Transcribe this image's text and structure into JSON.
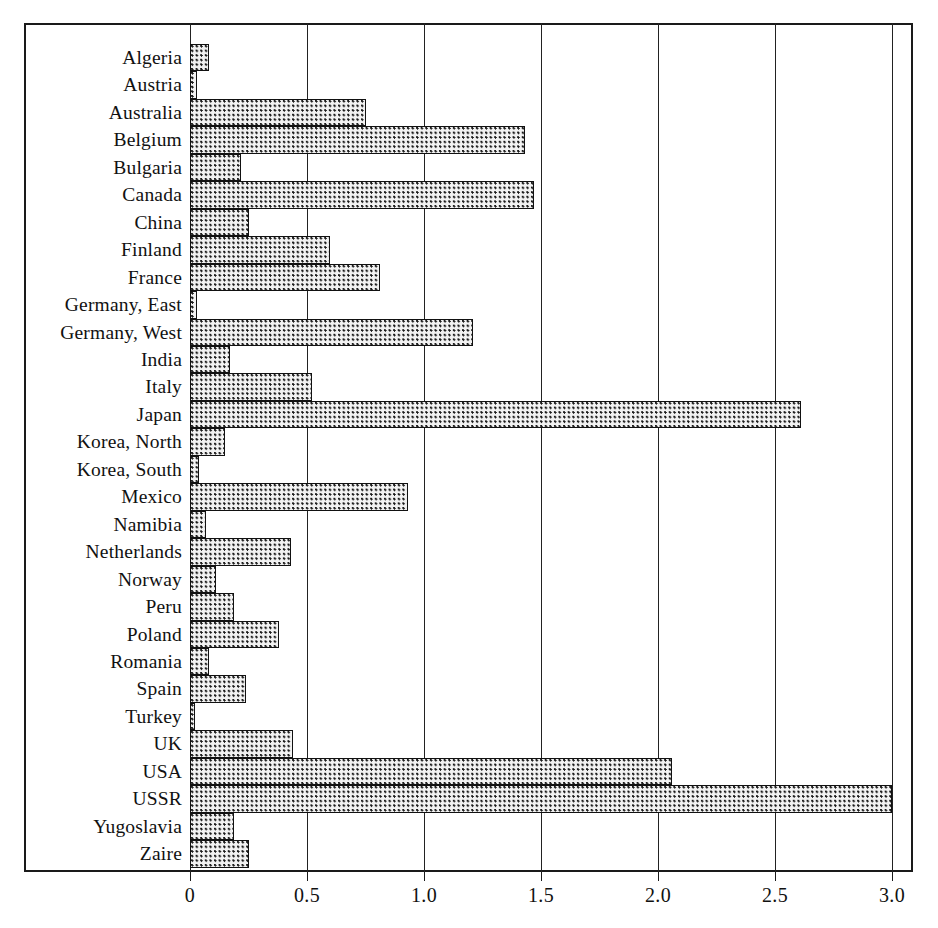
{
  "chart_data": {
    "type": "bar",
    "orientation": "horizontal",
    "title": "",
    "xlabel": "",
    "ylabel": "",
    "xlim": [
      0,
      3.0
    ],
    "xticks": [
      0,
      0.5,
      1.0,
      1.5,
      2.0,
      2.5,
      3.0
    ],
    "xtick_labels": [
      "0",
      "0.5",
      "1.0",
      "1.5",
      "2.0",
      "2.5",
      "3.0"
    ],
    "grid": true,
    "grid_axis": "x",
    "legend": null,
    "bar_fill": "stippled-dot-pattern",
    "bar_edge_color": "#111111",
    "bar_face_color": "#f2f2f2",
    "categories": [
      "Algeria",
      "Austria",
      "Australia",
      "Belgium",
      "Bulgaria",
      "Canada",
      "China",
      "Finland",
      "France",
      "Germany, East",
      "Germany, West",
      "India",
      "Italy",
      "Japan",
      "Korea, North",
      "Korea, South",
      "Mexico",
      "Namibia",
      "Netherlands",
      "Norway",
      "Peru",
      "Poland",
      "Romania",
      "Spain",
      "Turkey",
      "UK",
      "USA",
      "USSR",
      "Yugoslavia",
      "Zaire"
    ],
    "values": [
      0.08,
      0.03,
      0.75,
      1.43,
      0.22,
      1.47,
      0.25,
      0.6,
      0.81,
      0.03,
      1.21,
      0.17,
      0.52,
      2.61,
      0.15,
      0.04,
      0.93,
      0.07,
      0.43,
      0.11,
      0.19,
      0.38,
      0.08,
      0.24,
      0.02,
      0.44,
      2.06,
      3.0,
      0.19,
      0.25
    ]
  }
}
